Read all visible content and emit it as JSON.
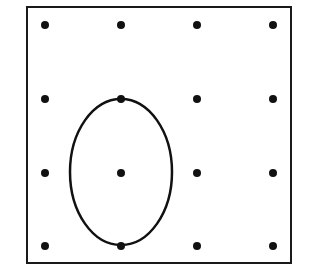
{
  "diagram": {
    "type": "dot-grid-with-ellipse",
    "frame": {
      "x": 27,
      "y": 7,
      "width": 264,
      "height": 256,
      "stroke": "#1a1a1a",
      "stroke_width": 2
    },
    "grid": {
      "rows": 4,
      "cols": 4,
      "xs": [
        45,
        121,
        197,
        273
      ],
      "ys": [
        25,
        99,
        173,
        246
      ],
      "dot_radius": 4,
      "dot_color": "#111111"
    },
    "ellipse": {
      "cx": 121,
      "cy": 172,
      "rx": 51,
      "ry": 73,
      "stroke": "#111111",
      "stroke_width": 2.5,
      "passes_through_dots": [
        [
          1,
          1
        ],
        [
          1,
          3
        ]
      ],
      "encloses_dot": [
        1,
        2
      ]
    }
  }
}
